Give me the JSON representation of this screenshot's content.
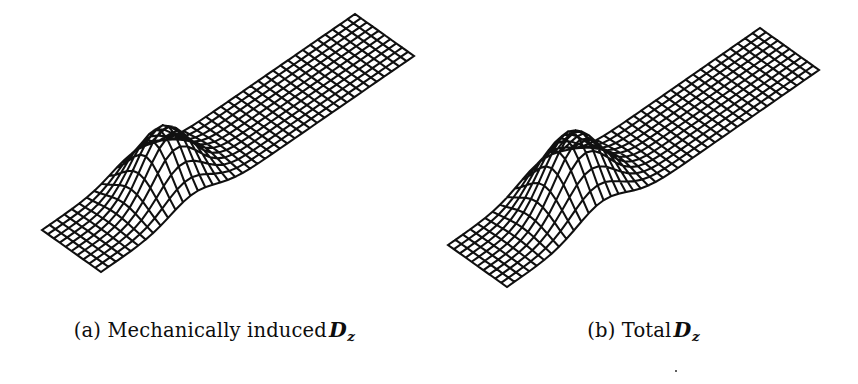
{
  "figure": {
    "kind": "two-panel-3d-mesh-surface-plot",
    "background_color": "#ffffff",
    "line_color": "#101010",
    "width": 858,
    "height": 384
  },
  "panels": [
    {
      "id": "a",
      "caption_label": "(a)",
      "caption_text": "Mechanically induced",
      "caption_symbol": "D",
      "caption_subscript": "z",
      "caption_full": "(a) Mechanically induced D_z"
    },
    {
      "id": "b",
      "caption_label": "(b)",
      "caption_text": "Total",
      "caption_symbol": "D",
      "caption_subscript": "z",
      "caption_full": "(b) Total D_z"
    }
  ],
  "chart_data": {
    "type": "surface-mesh",
    "title": "",
    "xlabel": "",
    "ylabel": "",
    "grid": true,
    "legend": null,
    "surfaces": [
      {
        "name": "Mechanically induced Dz",
        "panel": "a",
        "nx": 42,
        "ny": 10,
        "plate_length": 1.0,
        "plate_width": 0.235,
        "bump_center_u": 0.295,
        "bump_center_v": 0.5,
        "bump_sigma_u": 0.072,
        "bump_sigma_v": 0.3,
        "bump_amplitude": 0.155,
        "projection": {
          "corner_left": [
            42,
            230
          ],
          "corner_top": [
            355,
            14
          ],
          "corner_right": [
            413,
            58
          ],
          "corner_bottom": [
            101,
            272
          ]
        }
      },
      {
        "name": "Total Dz",
        "panel": "b",
        "nx": 42,
        "ny": 10,
        "plate_length": 1.0,
        "plate_width": 0.235,
        "bump_center_u": 0.305,
        "bump_center_v": 0.5,
        "bump_sigma_u": 0.078,
        "bump_sigma_v": 0.32,
        "bump_amplitude": 0.175,
        "projection": {
          "corner_left": [
            19,
            245
          ],
          "corner_top": [
            331,
            28
          ],
          "corner_right": [
            389,
            72
          ],
          "corner_bottom": [
            78,
            287
          ]
        }
      }
    ]
  }
}
